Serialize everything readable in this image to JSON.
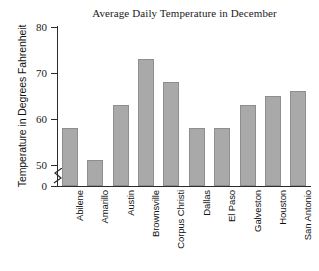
{
  "chart_data": {
    "type": "bar",
    "title": "Average Daily Temperature in December",
    "xlabel": "",
    "ylabel": "Temperature in Degrees Fahrenheit",
    "categories": [
      "Abilene",
      "Amarillo",
      "Austin",
      "Brownsville",
      "Corpus Christi",
      "Dallas",
      "El Paso",
      "Galveston",
      "Houston",
      "San Antonio"
    ],
    "values": [
      58,
      51,
      63,
      73,
      68,
      58,
      58,
      63,
      65,
      66
    ],
    "ytick_labels": [
      "80",
      "70",
      "60",
      "50",
      "0"
    ],
    "ytick_values": [
      80,
      70,
      60,
      50,
      0
    ],
    "ylim": [
      0,
      80
    ],
    "axis_break": true,
    "axis_break_between": [
      0,
      50
    ],
    "grid": false,
    "legend": false,
    "bar_color": "#a9a9a9",
    "bar_edge_color": "#8e8e8e",
    "axis_color": "#2b2b2b",
    "text_color": "#1a1a1a"
  }
}
